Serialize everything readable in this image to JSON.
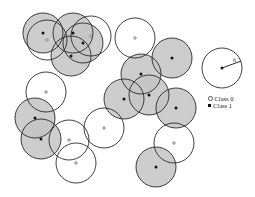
{
  "diagram": {
    "radius": 20,
    "fill_class1": "#c4c4c4",
    "stroke": "#2a2a2a",
    "circles": [
      {
        "cx": 43,
        "cy": 33,
        "cls": 1
      },
      {
        "cx": 47,
        "cy": 40,
        "cls": 0
      },
      {
        "cx": 73,
        "cy": 33,
        "cls": 1
      },
      {
        "cx": 91,
        "cy": 36,
        "cls": 0
      },
      {
        "cx": 83,
        "cy": 43,
        "cls": 1
      },
      {
        "cx": 71,
        "cy": 56,
        "cls": 1
      },
      {
        "cx": 135,
        "cy": 38,
        "cls": 0
      },
      {
        "cx": 172,
        "cy": 58,
        "cls": 1
      },
      {
        "cx": 46,
        "cy": 92,
        "cls": 0
      },
      {
        "cx": 141,
        "cy": 74,
        "cls": 1
      },
      {
        "cx": 124,
        "cy": 99,
        "cls": 1
      },
      {
        "cx": 149,
        "cy": 95,
        "cls": 1
      },
      {
        "cx": 176,
        "cy": 108,
        "cls": 1
      },
      {
        "cx": 35,
        "cy": 118,
        "cls": 1
      },
      {
        "cx": 41,
        "cy": 139,
        "cls": 1
      },
      {
        "cx": 69,
        "cy": 140,
        "cls": 0
      },
      {
        "cx": 76,
        "cy": 163,
        "cls": 0
      },
      {
        "cx": 104,
        "cy": 128,
        "cls": 0
      },
      {
        "cx": 174,
        "cy": 143,
        "cls": 0
      },
      {
        "cx": 156,
        "cy": 167,
        "cls": 1
      }
    ],
    "radius_demo": {
      "cx": 222,
      "cy": 68,
      "r": 20,
      "label": "h"
    }
  },
  "legend": {
    "class0": "Class 0",
    "class1": "Class 1"
  }
}
